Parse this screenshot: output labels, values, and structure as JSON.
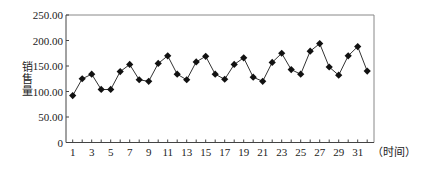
{
  "chart_data": {
    "type": "line",
    "title": "",
    "xlabel": "（时间）",
    "ylabel": "销售量",
    "ylim": [
      0,
      250
    ],
    "xlim": [
      1,
      32
    ],
    "yticks": [
      "0",
      "50.00",
      "100.00",
      "150.00",
      "200.00",
      "250.00"
    ],
    "yticks_values": [
      0,
      50,
      100,
      150,
      200,
      250
    ],
    "xtick_labels": [
      "1",
      "3",
      "5",
      "7",
      "9",
      "11",
      "13",
      "15",
      "17",
      "19",
      "21",
      "23",
      "25",
      "27",
      "29",
      "31"
    ],
    "grid": false,
    "legend": null,
    "marker": "diamond",
    "x": [
      1,
      2,
      3,
      4,
      5,
      6,
      7,
      8,
      9,
      10,
      11,
      12,
      13,
      14,
      15,
      16,
      17,
      18,
      19,
      20,
      21,
      22,
      23,
      24,
      25,
      26,
      27,
      28,
      29,
      30,
      31,
      32
    ],
    "series": [
      {
        "name": "销售量",
        "values": [
          92,
          125,
          134,
          104,
          104,
          139,
          153,
          123,
          120,
          155,
          170,
          134,
          123,
          158,
          169,
          134,
          124,
          153,
          166,
          128,
          120,
          157,
          175,
          143,
          134,
          179,
          194,
          148,
          132,
          170,
          188,
          140
        ]
      }
    ]
  },
  "colors": {
    "line": "#333333",
    "marker": "#111111",
    "axis": "#444444",
    "frame": "#888888"
  }
}
